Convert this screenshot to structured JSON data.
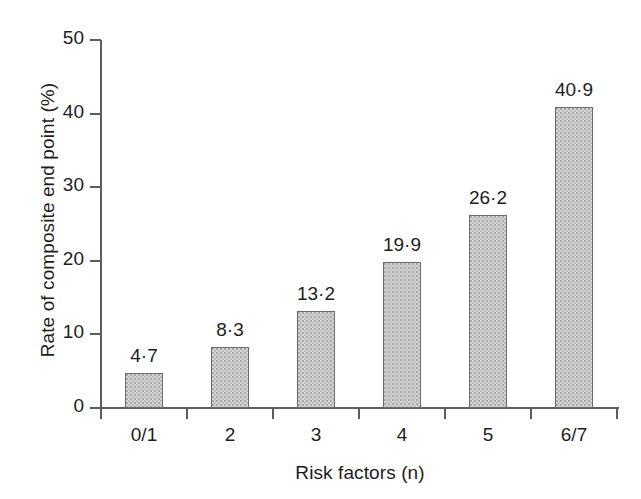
{
  "chart_data": {
    "type": "bar",
    "title": "",
    "subtitle": "",
    "xlabel": "Risk factors (n)",
    "ylabel": "Rate of composite end point (%)",
    "categories": [
      "0/1",
      "2",
      "3",
      "4",
      "5",
      "6/7"
    ],
    "values": [
      4.7,
      8.3,
      13.2,
      19.9,
      26.2,
      40.9
    ],
    "value_labels": [
      "4·7",
      "8·3",
      "13·2",
      "19·9",
      "26·2",
      "40·9"
    ],
    "ylim": [
      0,
      50
    ],
    "ytick_values": [
      0,
      10,
      20,
      30,
      40,
      50
    ],
    "ytick_labels": [
      "0",
      "10",
      "20",
      "30",
      "40",
      "50"
    ],
    "grid": false,
    "legend": null,
    "legend_position": "none",
    "bar_fill_color": "#d4d4d4",
    "bar_border_color": "#6b6b6b",
    "axis_color": "#5d5d5d",
    "text_color": "#1d1d1d",
    "background_color": "#ffffff",
    "decimal_separator": "·",
    "annotations": []
  }
}
